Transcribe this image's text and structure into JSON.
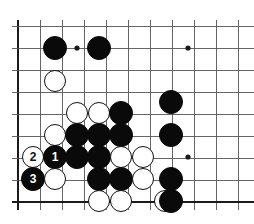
{
  "figure": {
    "kind": "go-board-diagram",
    "background_color": "#ffffff",
    "line_color": "#555555",
    "edge_color": "#1a1a1a",
    "black_color": "#0a0a0a",
    "white_color": "#ffffff"
  },
  "board": {
    "origin_x": 18,
    "origin_y": 26,
    "spacing": 22,
    "cols": 11,
    "rows": 9,
    "left_edge_thick": true,
    "bottom_edge_thick": true,
    "star_points": [
      {
        "x": 77,
        "y": 48
      },
      {
        "x": 188,
        "y": 48
      },
      {
        "x": 188,
        "y": 157
      }
    ]
  },
  "stones": [
    {
      "id": "b-c55-r48",
      "color": "black",
      "x": 55,
      "y": 48,
      "radius": 12,
      "label": ""
    },
    {
      "id": "b-c99-r48",
      "color": "black",
      "x": 99,
      "y": 48,
      "radius": 12,
      "label": ""
    },
    {
      "id": "w-c55-r81",
      "color": "white",
      "x": 55,
      "y": 81,
      "radius": 11,
      "label": ""
    },
    {
      "id": "w-c77-r113",
      "color": "white",
      "x": 77,
      "y": 113,
      "radius": 11,
      "label": ""
    },
    {
      "id": "w-c99-r113",
      "color": "white",
      "x": 99,
      "y": 113,
      "radius": 11,
      "label": ""
    },
    {
      "id": "b-c121-r113",
      "color": "black",
      "x": 121,
      "y": 113,
      "radius": 12,
      "label": ""
    },
    {
      "id": "b-c171-r102",
      "color": "black",
      "x": 171,
      "y": 102,
      "radius": 12,
      "label": ""
    },
    {
      "id": "w-c55-r135",
      "color": "white",
      "x": 55,
      "y": 135,
      "radius": 11,
      "label": ""
    },
    {
      "id": "b-c77-r135",
      "color": "black",
      "x": 77,
      "y": 135,
      "radius": 12,
      "label": ""
    },
    {
      "id": "b-c99-r135",
      "color": "black",
      "x": 99,
      "y": 135,
      "radius": 12,
      "label": ""
    },
    {
      "id": "b-c121-r135",
      "color": "black",
      "x": 121,
      "y": 135,
      "radius": 12,
      "label": ""
    },
    {
      "id": "b-c171-r135",
      "color": "black",
      "x": 171,
      "y": 135,
      "radius": 12,
      "label": ""
    },
    {
      "id": "w-c55-r157",
      "color": "white",
      "x": 55,
      "y": 157,
      "radius": 11,
      "label": ""
    },
    {
      "id": "w-move2",
      "color": "white",
      "x": 33,
      "y": 157,
      "radius": 11,
      "label": "2"
    },
    {
      "id": "b-move1",
      "color": "black",
      "x": 55,
      "y": 157,
      "radius": 12,
      "label": "1"
    },
    {
      "id": "b-c77-r157",
      "color": "black",
      "x": 77,
      "y": 157,
      "radius": 12,
      "label": ""
    },
    {
      "id": "b-c99-r157",
      "color": "black",
      "x": 99,
      "y": 157,
      "radius": 12,
      "label": ""
    },
    {
      "id": "w-c121-r157",
      "color": "white",
      "x": 121,
      "y": 157,
      "radius": 11,
      "label": ""
    },
    {
      "id": "w-c143-r157",
      "color": "white",
      "x": 143,
      "y": 157,
      "radius": 11,
      "label": ""
    },
    {
      "id": "b-move3",
      "color": "black",
      "x": 33,
      "y": 179,
      "radius": 12,
      "label": "3"
    },
    {
      "id": "w-c55-r179",
      "color": "white",
      "x": 55,
      "y": 179,
      "radius": 11,
      "label": ""
    },
    {
      "id": "b-c99-r179",
      "color": "black",
      "x": 99,
      "y": 179,
      "radius": 12,
      "label": ""
    },
    {
      "id": "b-c121-r179",
      "color": "black",
      "x": 121,
      "y": 179,
      "radius": 12,
      "label": ""
    },
    {
      "id": "w-c143-r179",
      "color": "white",
      "x": 143,
      "y": 179,
      "radius": 11,
      "label": ""
    },
    {
      "id": "b-c171-r179",
      "color": "black",
      "x": 171,
      "y": 179,
      "radius": 12,
      "label": ""
    },
    {
      "id": "w-c99-r201",
      "color": "white",
      "x": 99,
      "y": 201,
      "radius": 11,
      "label": ""
    },
    {
      "id": "w-c121-r201",
      "color": "white",
      "x": 121,
      "y": 201,
      "radius": 11,
      "label": ""
    },
    {
      "id": "w-c165-r201",
      "color": "white",
      "x": 165,
      "y": 201,
      "radius": 11,
      "label": ""
    },
    {
      "id": "b-c171-r201",
      "color": "black",
      "x": 171,
      "y": 201,
      "radius": 12,
      "label": ""
    }
  ],
  "move_sequence": [
    {
      "number": "1",
      "color": "black"
    },
    {
      "number": "2",
      "color": "white"
    },
    {
      "number": "3",
      "color": "black"
    }
  ]
}
